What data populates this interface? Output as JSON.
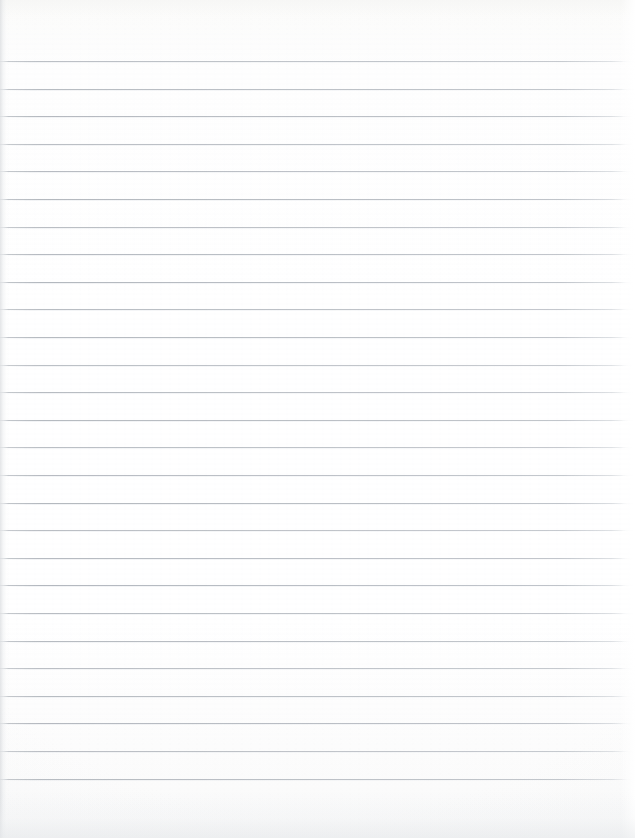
{
  "document": {
    "kind": "ruled-notebook-paper-scan",
    "title": "",
    "body_text": "",
    "is_blank": true,
    "page_width": 635,
    "page_height": 838,
    "background_color": "#fdfdfd",
    "paper_tint": "#ffffff"
  },
  "ruling": {
    "line_color": "#aeb3ba",
    "line_thickness_px": 1,
    "line_spacing_px": 27.6,
    "first_line_y": 61,
    "last_line_y": 787,
    "line_count": 27,
    "left_inset_px": 0,
    "right_end_px": 626,
    "has_vertical_margin_rule": false,
    "line_y_positions": [
      61,
      88.6,
      116.2,
      143.8,
      171.4,
      199,
      226.6,
      254.2,
      281.8,
      309.4,
      337,
      364.6,
      392.2,
      419.8,
      447.4,
      475,
      502.6,
      530.2,
      557.8,
      585.4,
      613,
      640.6,
      668.2,
      695.8,
      723.4,
      751,
      778.6
    ]
  },
  "margins": {
    "top_blank_px": 61,
    "bottom_blank_px": 50,
    "left_edge_shadow_px": 9,
    "right_edge_highlight_px": 14
  },
  "content": {
    "lines_of_text": [],
    "note": ""
  }
}
